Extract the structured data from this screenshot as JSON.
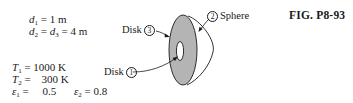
{
  "figure": {
    "caption": "FIG. P8-93"
  },
  "given": {
    "d1": {
      "symbol": "d",
      "sub": "1",
      "eq": " = 1 m"
    },
    "d23": {
      "symbol": "d",
      "sub": "2",
      "mid": " = ",
      "symbol2": "d",
      "sub2": "3",
      "eq": " = 4 m"
    },
    "T1": {
      "symbol": "T",
      "sub": "1",
      "eq": " = 1000 K"
    },
    "T2": {
      "symbol": "T",
      "sub": "2",
      "eq": " =    300 K"
    },
    "e1": {
      "symbol": "ε",
      "sub": "1",
      "eq": " =     0.5"
    },
    "e2": {
      "symbol": "ε",
      "sub": "2",
      "eq": " = 0.8"
    }
  },
  "labels": {
    "disk3": {
      "text": "Disk",
      "num": "3"
    },
    "disk1": {
      "text": "Disk",
      "num": "1"
    },
    "sphere": {
      "text": "Sphere",
      "num": "2"
    }
  },
  "colors": {
    "disk_fill": "#b4b4b4",
    "stroke": "#1a1a1a",
    "background": "#ffffff"
  }
}
